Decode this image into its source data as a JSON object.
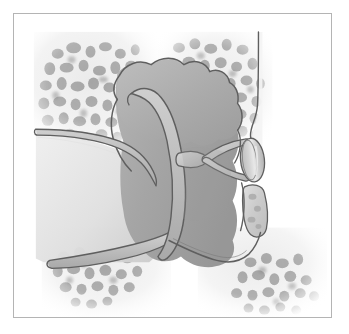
{
  "figure": {
    "domain": "Natural-Image",
    "kind": "medical-illustration",
    "description": "Grayscale anatomical line drawing showing the external auditory canal, tympanic membrane, ossicular chain and tympanic cavity surrounded by cancellous temporal bone."
  },
  "canvas": {
    "width": 349,
    "height": 334,
    "background": "#ffffff"
  },
  "frame": {
    "x": 13,
    "y": 13,
    "width": 319,
    "height": 305,
    "border_color": "#b4b4b4",
    "border_width": 1,
    "fill": "#ffffff"
  },
  "palette": {
    "paper_white": "#ffffff",
    "bone_field": "#efefef",
    "bone_field_edge": "#f7f7f7",
    "trabecula_light": "#c8c8c8",
    "trabecula_mid": "#a8a8a8",
    "trabecula_dark": "#8e8e8e",
    "canal_lumen_light": "#e6e6e6",
    "canal_lumen_mid": "#d8d8d8",
    "soft_tissue_light": "#c4c4c4",
    "soft_tissue_mid": "#ababab",
    "soft_tissue_dark": "#9a9a9a",
    "cavity_fill": "#a3a3a3",
    "cavity_fill_deep": "#959595",
    "membrane_band": "#bdbdbd",
    "ossicle_fill": "#c9c9c9",
    "ossicle_highlight": "#e4e4e4",
    "outline": "#5f5f5f",
    "outline_soft": "#777777"
  },
  "structures": [
    {
      "id": "temporal-bone-upper-left",
      "label": "Cancellous temporal bone, superior-lateral",
      "region": "top-left"
    },
    {
      "id": "temporal-bone-upper-right",
      "label": "Cancellous temporal bone, superior-medial",
      "region": "top-right"
    },
    {
      "id": "temporal-bone-lower-left",
      "label": "Cancellous temporal bone, inferior-lateral",
      "region": "bottom-left"
    },
    {
      "id": "temporal-bone-lower-right",
      "label": "Cancellous temporal bone, inferior-medial",
      "region": "bottom-right"
    },
    {
      "id": "external-auditory-canal",
      "label": "External auditory canal",
      "region": "left"
    },
    {
      "id": "canal-wall-superior",
      "label": "Superior canal wall",
      "region": "left-upper"
    },
    {
      "id": "canal-wall-inferior",
      "label": "Inferior canal wall",
      "region": "left-lower"
    },
    {
      "id": "tympanic-membrane",
      "label": "Tympanic membrane",
      "region": "center"
    },
    {
      "id": "epitympanum",
      "label": "Epitympanic recess (attic)",
      "region": "center-top"
    },
    {
      "id": "tympanic-cavity",
      "label": "Tympanic cavity",
      "region": "center-right"
    },
    {
      "id": "ossicle-long-process",
      "label": "Long process of incus",
      "region": "center-right"
    },
    {
      "id": "stapes-crura",
      "label": "Crura of the stapes",
      "region": "right-center"
    },
    {
      "id": "stapes-footplate",
      "label": "Stapes footplate in the oval window",
      "region": "right-center"
    },
    {
      "id": "round-window-bone",
      "label": "Promontory bone segment below the oval window",
      "region": "right-lower"
    },
    {
      "id": "lateral-bony-wall",
      "label": "Lateral bony wall margin",
      "region": "right-top"
    },
    {
      "id": "hypotympanum-floor",
      "label": "Floor of the tympanic cavity",
      "region": "bottom-center"
    }
  ]
}
